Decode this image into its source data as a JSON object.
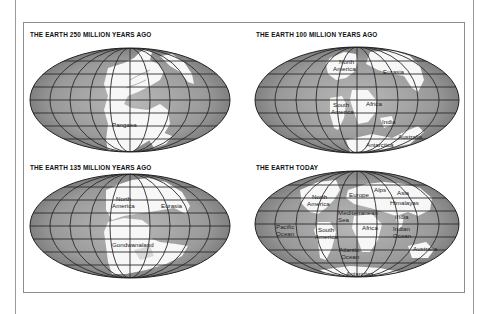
{
  "figure": {
    "panels": [
      {
        "id": "250mya",
        "title": "THE EARTH 250 MILLION YEARS AGO",
        "labels": [
          {
            "text": "Pangaea",
            "x": 132,
            "y": 127
          }
        ]
      },
      {
        "id": "100mya",
        "title": "THE EARTH 100 MILLION YEARS AGO",
        "labels": [
          {
            "text": "North",
            "x": 339,
            "y": 64
          },
          {
            "text": "America",
            "x": 333,
            "y": 71
          },
          {
            "text": "Eurasia",
            "x": 383,
            "y": 74
          },
          {
            "text": "South",
            "x": 333,
            "y": 107
          },
          {
            "text": "America",
            "x": 331,
            "y": 114
          },
          {
            "text": "Africa",
            "x": 366,
            "y": 106
          },
          {
            "text": "India",
            "x": 382,
            "y": 124
          },
          {
            "text": "Antarctica",
            "x": 367,
            "y": 146
          },
          {
            "text": "Australia",
            "x": 400,
            "y": 138
          }
        ]
      },
      {
        "id": "135mya",
        "title": "THE EARTH 135 MILLION YEARS AGO",
        "labels": [
          {
            "text": "North",
            "x": 116,
            "y": 201
          },
          {
            "text": "America",
            "x": 112,
            "y": 208
          },
          {
            "text": "Eurasia",
            "x": 161,
            "y": 208
          },
          {
            "text": "Gondwanaland",
            "x": 112,
            "y": 246
          }
        ]
      },
      {
        "id": "today",
        "title": "THE EARTH TODAY",
        "labels": [
          {
            "text": "North",
            "x": 312,
            "y": 199
          },
          {
            "text": "America",
            "x": 307,
            "y": 206
          },
          {
            "text": "Europe",
            "x": 349,
            "y": 197
          },
          {
            "text": "Alps",
            "x": 374,
            "y": 192
          },
          {
            "text": "Asia",
            "x": 397,
            "y": 195
          },
          {
            "text": "Himalayas",
            "x": 390,
            "y": 205
          },
          {
            "text": "Mediterranean",
            "x": 338,
            "y": 215
          },
          {
            "text": "Sea",
            "x": 338,
            "y": 222
          },
          {
            "text": "India",
            "x": 395,
            "y": 219
          },
          {
            "text": "Pacific",
            "x": 276,
            "y": 229
          },
          {
            "text": "Ocean",
            "x": 276,
            "y": 236
          },
          {
            "text": "South",
            "x": 318,
            "y": 232
          },
          {
            "text": "America",
            "x": 315,
            "y": 239
          },
          {
            "text": "Africa",
            "x": 362,
            "y": 230
          },
          {
            "text": "Indian",
            "x": 393,
            "y": 231
          },
          {
            "text": "Ocean",
            "x": 393,
            "y": 238
          },
          {
            "text": "Atlantic",
            "x": 339,
            "y": 252
          },
          {
            "text": "Ocean",
            "x": 341,
            "y": 259
          },
          {
            "text": "Australia",
            "x": 413,
            "y": 251
          },
          {
            "text": "Antarctica",
            "x": 346,
            "y": 275
          }
        ]
      }
    ]
  },
  "colors": {
    "ocean_light": "#b4b4b4",
    "ocean_dark": "#7a7a7a",
    "land": "#f7f7f7",
    "gridline": "#2a2a2a"
  }
}
